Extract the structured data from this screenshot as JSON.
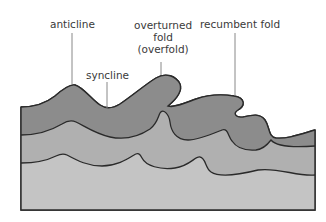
{
  "diagram": {
    "labels": {
      "anticline": "anticline",
      "syncline": "syncline",
      "overturned_line1": "overturned",
      "overturned_line2": "fold",
      "overturned_line3": "(overfold)",
      "recumbent": "recumbent fold"
    },
    "colors": {
      "top_layer": "#8c8c8c",
      "middle_layer": "#b0b0b0",
      "bottom_layer": "#c4c4c4",
      "outline": "#2a2a2a",
      "leader_line": "#888888",
      "label_text": "#3a3a3a"
    },
    "layers": [
      "top layer (dark grey)",
      "middle layer (medium grey)",
      "bottom layer (light grey)"
    ]
  }
}
